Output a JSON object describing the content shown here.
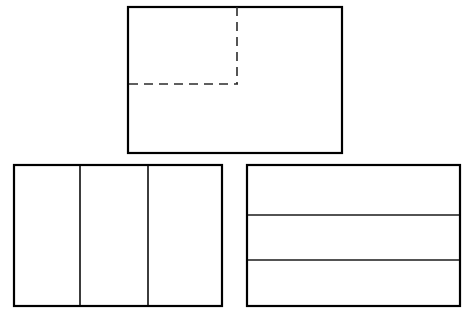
{
  "document": {
    "title": "Orthographic Three-View Rectangle Sketch",
    "background_color": "#ffffff",
    "line_color": "#000000",
    "hidden_line_color": "#2b2b2b",
    "width": 470,
    "height": 318
  },
  "figures": [
    {
      "id": "top-view",
      "name": "Top rectangle with hidden-line corner",
      "shape": "rectangle",
      "x": 128,
      "y": 7,
      "width": 214,
      "height": 146,
      "stroke_width": 2.2,
      "fill": "#ffffff",
      "stroke": "#000000",
      "hidden_lines": [
        {
          "id": "hidden-vertical",
          "orientation": "vertical",
          "x1": 237,
          "y1": 7,
          "x2": 237,
          "y2": 84,
          "dash_pattern": "9 6"
        },
        {
          "id": "hidden-horizontal",
          "orientation": "horizontal",
          "x1": 129,
          "y1": 84,
          "x2": 238,
          "y2": 84,
          "dash_pattern": "9 6"
        }
      ],
      "dividers": []
    },
    {
      "id": "front-view",
      "name": "Bottom-left rectangle with three vertical panels",
      "shape": "rectangle",
      "x": 14,
      "y": 165,
      "width": 208,
      "height": 141,
      "stroke_width": 2.2,
      "fill": "#ffffff",
      "stroke": "#000000",
      "hidden_lines": [],
      "dividers": [
        {
          "id": "vertical-divider-1",
          "orientation": "vertical",
          "x1": 80,
          "y1": 166,
          "x2": 80,
          "y2": 305
        },
        {
          "id": "vertical-divider-2",
          "orientation": "vertical",
          "x1": 148,
          "y1": 166,
          "x2": 148,
          "y2": 305
        }
      ],
      "panel_count": 3
    },
    {
      "id": "side-view",
      "name": "Bottom-right rectangle with three horizontal bands",
      "shape": "rectangle",
      "x": 247,
      "y": 165,
      "width": 213,
      "height": 141,
      "stroke_width": 2.2,
      "fill": "#ffffff",
      "stroke": "#000000",
      "hidden_lines": [],
      "dividers": [
        {
          "id": "horizontal-divider-1",
          "orientation": "horizontal",
          "x1": 248,
          "y1": 215,
          "x2": 459,
          "y2": 215
        },
        {
          "id": "horizontal-divider-2",
          "orientation": "horizontal",
          "x1": 248,
          "y1": 260,
          "x2": 459,
          "y2": 260
        }
      ],
      "panel_count": 3
    }
  ]
}
